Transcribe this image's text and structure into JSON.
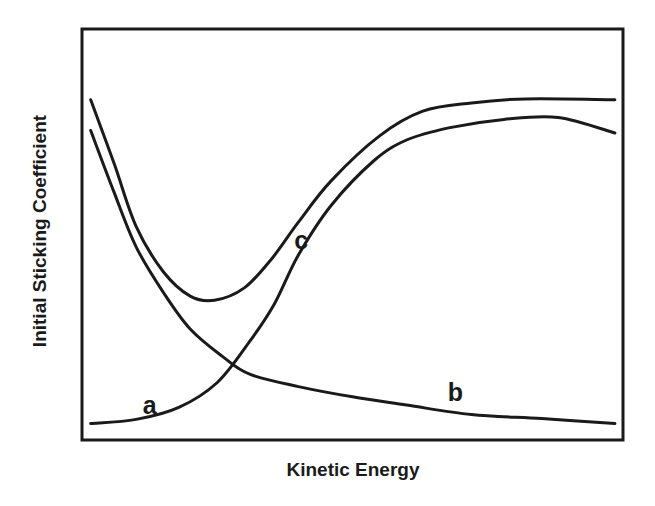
{
  "chart_data": {
    "type": "line",
    "title": "",
    "xlabel": "Kinetic Energy",
    "ylabel": "Initial Sticking Coefficient",
    "xlim": [
      0,
      1
    ],
    "ylim": [
      0,
      1
    ],
    "grid": false,
    "ticks": false,
    "legend": "none (curves labeled inline)",
    "colors": {
      "line": "#1a1a1a",
      "background": "#ffffff"
    },
    "series": [
      {
        "name": "a",
        "label_pos": [
          0.125,
          0.08
        ],
        "x": [
          0.016,
          0.1,
          0.18,
          0.25,
          0.31,
          0.355,
          0.4,
          0.46,
          0.54,
          0.6,
          0.68,
          0.78,
          0.88,
          0.985
        ],
        "y": [
          0.04,
          0.05,
          0.08,
          0.14,
          0.24,
          0.33,
          0.45,
          0.57,
          0.68,
          0.73,
          0.76,
          0.78,
          0.785,
          0.747
        ]
      },
      {
        "name": "b",
        "label_pos": [
          0.69,
          0.11
        ],
        "x": [
          0.016,
          0.06,
          0.1,
          0.15,
          0.2,
          0.26,
          0.31,
          0.4,
          0.5,
          0.6,
          0.72,
          0.85,
          0.985
        ],
        "y": [
          0.753,
          0.6,
          0.47,
          0.36,
          0.27,
          0.203,
          0.16,
          0.13,
          0.105,
          0.085,
          0.062,
          0.052,
          0.04
        ]
      },
      {
        "name": "c",
        "label_pos": [
          0.405,
          0.48
        ],
        "x": [
          0.016,
          0.06,
          0.1,
          0.15,
          0.2,
          0.245,
          0.3,
          0.35,
          0.4,
          0.46,
          0.55,
          0.63,
          0.72,
          0.82,
          0.985
        ],
        "y": [
          0.828,
          0.67,
          0.52,
          0.41,
          0.35,
          0.34,
          0.37,
          0.44,
          0.53,
          0.63,
          0.74,
          0.8,
          0.82,
          0.83,
          0.828
        ]
      }
    ]
  }
}
